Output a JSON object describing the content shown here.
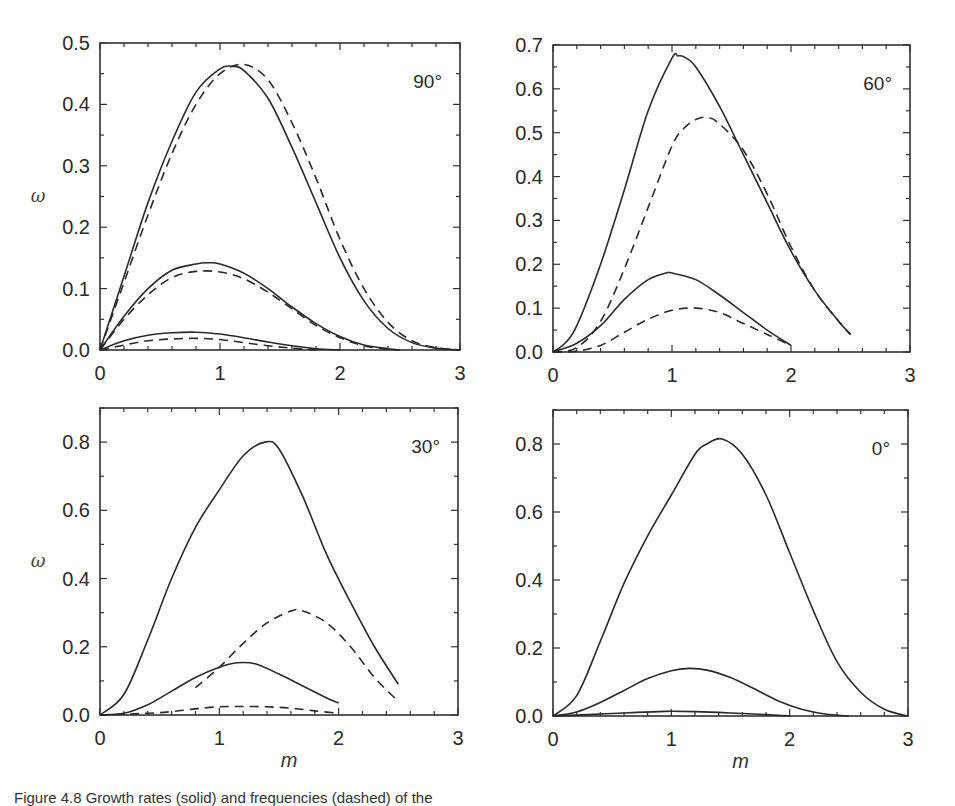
{
  "figure": {
    "caption": "Figure 4.8 Growth rates (solid) and frequencies (dashed) of the",
    "xlabel": "m",
    "ylabel": "ω"
  },
  "colors": {
    "line": "#2a2a2a",
    "frame": "#333333"
  },
  "chart_data": [
    {
      "type": "line",
      "title": "90°",
      "xlabel": "",
      "ylabel": "ω",
      "xlim": [
        0,
        3
      ],
      "ylim": [
        0,
        0.5
      ],
      "xticks": [
        "0",
        "1",
        "2",
        "3"
      ],
      "yticks": [
        "0.0",
        "0.1",
        "0.2",
        "0.3",
        "0.4",
        "0.5"
      ],
      "series": [
        {
          "name": "growth rate 1 (solid)",
          "style": "solid",
          "x": [
            0,
            0.2,
            0.4,
            0.6,
            0.8,
            1.0,
            1.1,
            1.2,
            1.4,
            1.6,
            1.8,
            2.0,
            2.2,
            2.4,
            2.6,
            2.8,
            3.0
          ],
          "values": [
            0,
            0.12,
            0.24,
            0.34,
            0.42,
            0.458,
            0.462,
            0.455,
            0.41,
            0.33,
            0.24,
            0.15,
            0.08,
            0.035,
            0.012,
            0.003,
            0
          ]
        },
        {
          "name": "frequency 1 (dashed)",
          "style": "dashed",
          "x": [
            0,
            0.2,
            0.4,
            0.6,
            0.8,
            1.0,
            1.2,
            1.4,
            1.6,
            1.8,
            2.0,
            2.2,
            2.4,
            2.6,
            2.8,
            3.0
          ],
          "values": [
            0,
            0.11,
            0.22,
            0.32,
            0.4,
            0.45,
            0.465,
            0.44,
            0.37,
            0.28,
            0.18,
            0.1,
            0.045,
            0.015,
            0.004,
            0
          ]
        },
        {
          "name": "growth rate 2 (solid)",
          "style": "solid",
          "x": [
            0,
            0.2,
            0.4,
            0.6,
            0.8,
            0.9,
            1.0,
            1.2,
            1.4,
            1.6,
            1.8,
            2.0,
            2.2,
            2.4,
            2.5
          ],
          "values": [
            0,
            0.055,
            0.1,
            0.13,
            0.14,
            0.142,
            0.14,
            0.125,
            0.1,
            0.07,
            0.043,
            0.022,
            0.008,
            0.002,
            0
          ]
        },
        {
          "name": "frequency 2 (dashed)",
          "style": "dashed",
          "x": [
            0,
            0.2,
            0.4,
            0.6,
            0.8,
            1.0,
            1.2,
            1.4,
            1.6,
            1.8,
            2.0,
            2.2,
            2.4,
            2.5
          ],
          "values": [
            0,
            0.05,
            0.09,
            0.118,
            0.128,
            0.127,
            0.116,
            0.094,
            0.067,
            0.04,
            0.02,
            0.007,
            0.001,
            0
          ]
        },
        {
          "name": "growth rate 3 (solid)",
          "style": "solid",
          "x": [
            0,
            0.2,
            0.4,
            0.6,
            0.8,
            1.0,
            1.2,
            1.4,
            1.6,
            1.8,
            2.0
          ],
          "values": [
            0,
            0.015,
            0.024,
            0.028,
            0.029,
            0.026,
            0.02,
            0.013,
            0.007,
            0.002,
            0
          ]
        },
        {
          "name": "frequency 3 (dashed)",
          "style": "dashed",
          "x": [
            0,
            0.2,
            0.4,
            0.6,
            0.8,
            1.0,
            1.2,
            1.4,
            1.6,
            1.8
          ],
          "values": [
            0,
            0.008,
            0.015,
            0.018,
            0.019,
            0.017,
            0.012,
            0.007,
            0.003,
            0
          ]
        }
      ]
    },
    {
      "type": "line",
      "title": "60°",
      "xlabel": "",
      "ylabel": "",
      "xlim": [
        0,
        3
      ],
      "ylim": [
        0,
        0.7
      ],
      "xticks": [
        "0",
        "1",
        "2",
        "3"
      ],
      "yticks": [
        "0.0",
        "0.1",
        "0.2",
        "0.3",
        "0.4",
        "0.5",
        "0.6",
        "0.7"
      ],
      "series": [
        {
          "name": "growth rate 1 (solid)",
          "style": "solid",
          "x": [
            0,
            0.1,
            0.2,
            0.4,
            0.6,
            0.8,
            1.0,
            1.05,
            1.1,
            1.2,
            1.4,
            1.6,
            1.8,
            2.0,
            2.2,
            2.4,
            2.5
          ],
          "values": [
            0,
            0.02,
            0.06,
            0.2,
            0.37,
            0.55,
            0.67,
            0.675,
            0.673,
            0.65,
            0.56,
            0.45,
            0.34,
            0.23,
            0.14,
            0.07,
            0.04
          ]
        },
        {
          "name": "frequency 1 (dashed)",
          "style": "dashed",
          "x": [
            0,
            0.2,
            0.4,
            0.6,
            0.8,
            1.0,
            1.1,
            1.2,
            1.3,
            1.4,
            1.6,
            1.8,
            2.0,
            2.2,
            2.4,
            2.5
          ],
          "values": [
            0,
            0.01,
            0.07,
            0.19,
            0.33,
            0.47,
            0.51,
            0.53,
            0.535,
            0.52,
            0.46,
            0.36,
            0.24,
            0.14,
            0.07,
            0.04
          ]
        },
        {
          "name": "growth rate 2 (solid)",
          "style": "solid",
          "x": [
            0,
            0.2,
            0.4,
            0.6,
            0.8,
            0.95,
            1.0,
            1.2,
            1.4,
            1.6,
            1.8,
            2.0
          ],
          "values": [
            0,
            0.02,
            0.06,
            0.12,
            0.165,
            0.18,
            0.18,
            0.165,
            0.13,
            0.09,
            0.05,
            0.015
          ]
        },
        {
          "name": "frequency 2 (dashed)",
          "style": "dashed",
          "x": [
            0,
            0.2,
            0.4,
            0.6,
            0.8,
            1.0,
            1.2,
            1.4,
            1.6,
            1.8,
            2.0
          ],
          "values": [
            0,
            0.002,
            0.015,
            0.045,
            0.075,
            0.095,
            0.1,
            0.09,
            0.065,
            0.04,
            0.015
          ]
        }
      ]
    },
    {
      "type": "line",
      "title": "30°",
      "xlabel": "m",
      "ylabel": "ω",
      "xlim": [
        0,
        3
      ],
      "ylim": [
        0,
        0.9
      ],
      "xticks": [
        "0",
        "1",
        "2",
        "3"
      ],
      "yticks": [
        "0.0",
        "0.2",
        "0.4",
        "0.6",
        "0.8"
      ],
      "series": [
        {
          "name": "growth rate 1 (solid)",
          "style": "solid",
          "x": [
            0,
            0.2,
            0.4,
            0.6,
            0.8,
            1.0,
            1.2,
            1.38,
            1.5,
            1.7,
            1.9,
            2.1,
            2.3,
            2.5
          ],
          "values": [
            0,
            0.06,
            0.22,
            0.4,
            0.55,
            0.66,
            0.76,
            0.8,
            0.78,
            0.64,
            0.47,
            0.33,
            0.2,
            0.09
          ]
        },
        {
          "name": "frequency 1 (dashed)",
          "style": "dashed",
          "x": [
            0.8,
            1.0,
            1.2,
            1.4,
            1.6,
            1.7,
            1.9,
            2.1,
            2.3,
            2.5
          ],
          "values": [
            0.08,
            0.14,
            0.21,
            0.27,
            0.305,
            0.305,
            0.27,
            0.2,
            0.11,
            0.04
          ]
        },
        {
          "name": "growth rate 2 (solid)",
          "style": "solid",
          "x": [
            0,
            0.2,
            0.4,
            0.6,
            0.8,
            1.0,
            1.15,
            1.3,
            1.5,
            1.7,
            1.9,
            2.0
          ],
          "values": [
            0,
            0.005,
            0.03,
            0.07,
            0.11,
            0.14,
            0.153,
            0.15,
            0.12,
            0.085,
            0.05,
            0.035
          ]
        },
        {
          "name": "frequency 2 (dashed)",
          "style": "dashed",
          "x": [
            0,
            0.4,
            0.6,
            0.8,
            1.0,
            1.2,
            1.4,
            1.6,
            1.8,
            2.0
          ],
          "values": [
            0,
            0.005,
            0.01,
            0.018,
            0.024,
            0.025,
            0.024,
            0.02,
            0.012,
            0.005
          ]
        }
      ]
    },
    {
      "type": "line",
      "title": "0°",
      "xlabel": "m",
      "ylabel": "",
      "xlim": [
        0,
        3
      ],
      "ylim": [
        0,
        0.9
      ],
      "xticks": [
        "0",
        "1",
        "2",
        "3"
      ],
      "yticks": [
        "0.0",
        "0.2",
        "0.4",
        "0.6",
        "0.8"
      ],
      "series": [
        {
          "name": "growth rate 1 (solid)",
          "style": "solid",
          "x": [
            0,
            0.2,
            0.4,
            0.6,
            0.8,
            1.0,
            1.2,
            1.3,
            1.43,
            1.6,
            1.8,
            2.0,
            2.2,
            2.4,
            2.6,
            2.8,
            3.0
          ],
          "values": [
            0,
            0.06,
            0.22,
            0.39,
            0.53,
            0.65,
            0.77,
            0.8,
            0.815,
            0.77,
            0.65,
            0.48,
            0.31,
            0.16,
            0.07,
            0.02,
            0
          ]
        },
        {
          "name": "growth rate 2 (solid)",
          "style": "solid",
          "x": [
            0,
            0.2,
            0.4,
            0.6,
            0.8,
            1.0,
            1.15,
            1.3,
            1.5,
            1.7,
            1.9,
            2.1,
            2.3,
            2.5
          ],
          "values": [
            0,
            0.012,
            0.04,
            0.075,
            0.11,
            0.133,
            0.14,
            0.135,
            0.113,
            0.08,
            0.045,
            0.02,
            0.006,
            0
          ]
        },
        {
          "name": "growth rate 3 (solid)",
          "style": "solid",
          "x": [
            0,
            0.3,
            0.6,
            0.9,
            1.0,
            1.2,
            1.5,
            1.8,
            2.0
          ],
          "values": [
            0,
            0.004,
            0.009,
            0.013,
            0.014,
            0.013,
            0.009,
            0.004,
            0
          ]
        }
      ]
    }
  ]
}
